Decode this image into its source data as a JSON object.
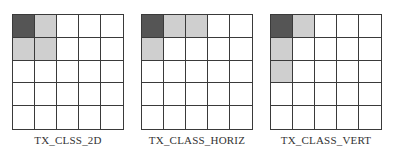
{
  "colors": {
    "border": "#3a3a3a",
    "dark": "#555555",
    "light": "#cfcfcf",
    "empty": "#ffffff"
  },
  "panels": [
    {
      "label": "TX_CLSS_2D",
      "cells": [
        [
          "dark",
          "light",
          "empty",
          "empty",
          "empty"
        ],
        [
          "light",
          "light",
          "empty",
          "empty",
          "empty"
        ],
        [
          "empty",
          "empty",
          "empty",
          "empty",
          "empty"
        ],
        [
          "empty",
          "empty",
          "empty",
          "empty",
          "empty"
        ],
        [
          "empty",
          "empty",
          "empty",
          "empty",
          "empty"
        ]
      ]
    },
    {
      "label": "TX_CLASS_HORIZ",
      "cells": [
        [
          "dark",
          "light",
          "light",
          "empty",
          "empty"
        ],
        [
          "light",
          "empty",
          "empty",
          "empty",
          "empty"
        ],
        [
          "empty",
          "empty",
          "empty",
          "empty",
          "empty"
        ],
        [
          "empty",
          "empty",
          "empty",
          "empty",
          "empty"
        ],
        [
          "empty",
          "empty",
          "empty",
          "empty",
          "empty"
        ]
      ]
    },
    {
      "label": "TX_CLASS_VERT",
      "cells": [
        [
          "dark",
          "light",
          "empty",
          "empty",
          "empty"
        ],
        [
          "light",
          "empty",
          "empty",
          "empty",
          "empty"
        ],
        [
          "light",
          "empty",
          "empty",
          "empty",
          "empty"
        ],
        [
          "empty",
          "empty",
          "empty",
          "empty",
          "empty"
        ],
        [
          "empty",
          "empty",
          "empty",
          "empty",
          "empty"
        ]
      ]
    }
  ]
}
